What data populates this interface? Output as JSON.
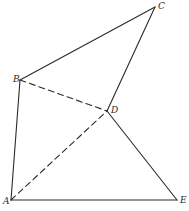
{
  "diagram": {
    "type": "geometric-figure",
    "vertices": [
      {
        "id": "A",
        "label": "A",
        "x": 11,
        "y": 200,
        "label_dx": -8,
        "label_dy": 4
      },
      {
        "id": "B",
        "label": "B",
        "x": 20,
        "y": 80,
        "label_dx": -7,
        "label_dy": 2
      },
      {
        "id": "C",
        "label": "C",
        "x": 155,
        "y": 7,
        "label_dx": 3,
        "label_dy": 2
      },
      {
        "id": "D",
        "label": "D",
        "x": 107,
        "y": 111,
        "label_dx": 4,
        "label_dy": 2
      },
      {
        "id": "E",
        "label": "E",
        "x": 177,
        "y": 200,
        "label_dx": 3,
        "label_dy": 3
      }
    ],
    "edges": [
      {
        "from": "A",
        "to": "B",
        "style": "solid"
      },
      {
        "from": "B",
        "to": "C",
        "style": "solid"
      },
      {
        "from": "C",
        "to": "D",
        "style": "solid"
      },
      {
        "from": "D",
        "to": "E",
        "style": "solid"
      },
      {
        "from": "A",
        "to": "E",
        "style": "solid"
      },
      {
        "from": "B",
        "to": "D",
        "style": "dashed"
      },
      {
        "from": "A",
        "to": "D",
        "style": "dashed"
      }
    ],
    "stroke_color": "#2a2a2a",
    "background_color": "#ffffff"
  }
}
